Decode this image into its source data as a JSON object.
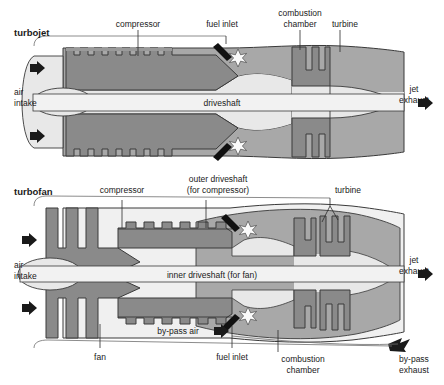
{
  "figure": {
    "type": "diagram",
    "colors": {
      "rotor_gray": "#8a8a8a",
      "casing_gray": "#a8a8a8",
      "flow_light": "#e8e8e8",
      "duct_light": "#f0f0f0",
      "outline": "#3a3a3a",
      "arrow_black": "#1a1a1a",
      "text": "#1a1a1a",
      "background": "#ffffff"
    }
  },
  "turbojet": {
    "title": "turbojet",
    "labels": {
      "compressor": "compressor",
      "fuel_inlet": "fuel inlet",
      "combustion_chamber_l1": "combustion",
      "combustion_chamber_l2": "chamber",
      "turbine": "turbine",
      "driveshaft": "driveshaft",
      "air_intake_l1": "air",
      "air_intake_l2": "intake",
      "jet_exhaust_l1": "jet",
      "jet_exhaust_l2": "exhaust"
    },
    "parts": {
      "compressor_stages": 8,
      "turbine_stages": 1,
      "spools": 1,
      "intake_arrows": 2,
      "exhaust_arrows": 1,
      "fuel_inlets": 2
    }
  },
  "turbofan": {
    "title": "turbofan",
    "labels": {
      "compressor": "compressor",
      "outer_driveshaft_l1": "outer driveshaft",
      "outer_driveshaft_l2": "(for compressor)",
      "turbine": "turbine",
      "inner_driveshaft": "inner driveshaft (for fan)",
      "air_intake_l1": "air",
      "air_intake_l2": "intake",
      "jet_exhaust_l1": "jet",
      "jet_exhaust_l2": "exhaust",
      "fan": "fan",
      "fuel_inlet": "fuel inlet",
      "combustion_chamber_l1": "combustion",
      "combustion_chamber_l2": "chamber",
      "bypass_air": "by-pass air",
      "bypass_exhaust_l1": "by-pass",
      "bypass_exhaust_l2": "exhaust"
    },
    "parts": {
      "fan_blades": 3,
      "compressor_stages": 6,
      "turbine_stages": 2,
      "spools": 2,
      "intake_arrows": 2,
      "exhaust_arrows": 1,
      "bypass_arrows": 2,
      "fuel_inlets": 2
    }
  }
}
